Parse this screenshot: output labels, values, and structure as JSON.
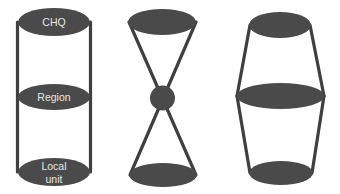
{
  "figure": {
    "type": "organizational-structure-diagram",
    "background_color": "#ffffff",
    "shape_fill_color": "#4a4a4a",
    "shape_stroke_color": "#3f3f3f",
    "label_text_color": "#e8e8e8"
  },
  "diagrams": [
    {
      "id": "cylinder-structure",
      "name": "Cylinder",
      "nodes": [
        {
          "id": "chq",
          "label": "CHQ",
          "label_lines": [
            "CHQ"
          ]
        },
        {
          "id": "region",
          "label": "Region",
          "label_lines": [
            "Region"
          ]
        },
        {
          "id": "local-unit",
          "label": "Local unit",
          "label_lines": [
            "Local",
            "unit"
          ]
        }
      ]
    },
    {
      "id": "hourglass-structure",
      "name": "Hourglass",
      "nodes": [
        {
          "id": "top",
          "label": "",
          "label_lines": []
        },
        {
          "id": "middle",
          "label": "",
          "label_lines": []
        },
        {
          "id": "bottom",
          "label": "",
          "label_lines": []
        }
      ]
    },
    {
      "id": "barrel-structure",
      "name": "Barrel",
      "nodes": [
        {
          "id": "top",
          "label": "",
          "label_lines": []
        },
        {
          "id": "middle",
          "label": "",
          "label_lines": []
        },
        {
          "id": "bottom",
          "label": "",
          "label_lines": []
        }
      ]
    }
  ],
  "labels": {
    "chq": "CHQ",
    "region": "Region",
    "local_line1": "Local",
    "local_line2": "unit"
  }
}
